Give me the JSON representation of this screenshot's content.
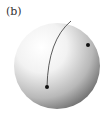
{
  "figure": {
    "label": "(b)",
    "sphere": {
      "cx": 57,
      "cy": 66,
      "r": 43
    },
    "curve": {
      "start": [
        71,
        21
      ],
      "control": [
        48,
        40
      ],
      "end": [
        47,
        87
      ]
    },
    "points": [
      {
        "id": "p1",
        "x": 47,
        "y": 87
      },
      {
        "id": "p2",
        "x": 88,
        "y": 45
      }
    ],
    "colors": {
      "highlight": "#ffffff",
      "shadow": "#5a5a5a",
      "curve": "#333333",
      "point": "#111111"
    }
  }
}
